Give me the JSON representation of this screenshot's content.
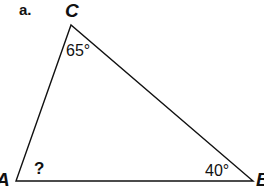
{
  "diagram": {
    "part_label": "a.",
    "vertices": {
      "A": {
        "label": "A",
        "x": 16,
        "y": 181
      },
      "B": {
        "label": "B",
        "x": 253,
        "y": 181
      },
      "C": {
        "label": "C",
        "x": 71,
        "y": 25
      }
    },
    "angles": {
      "C": "65°",
      "B": "40°",
      "A": "?"
    },
    "stroke_color": "#111111"
  }
}
